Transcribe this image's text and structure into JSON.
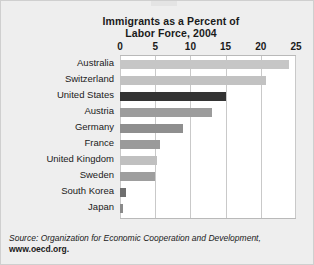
{
  "chart_data": {
    "type": "bar",
    "orientation": "horizontal",
    "title": "Immigrants as a Percent of Labor Force, 2004",
    "title_lines": [
      "Immigrants as a Percent of",
      "Labor Force, 2004"
    ],
    "xlabel": "",
    "ylabel": "",
    "xlim": [
      0,
      25
    ],
    "xticks": [
      0,
      5,
      10,
      15,
      20,
      25
    ],
    "xtick_labels": [
      "0",
      "5",
      "10",
      "15",
      "20",
      "25"
    ],
    "grid": true,
    "grid_axis": "x",
    "legend": false,
    "categories": [
      "Australia",
      "Switzerland",
      "United States",
      "Austria",
      "Germany",
      "France",
      "United Kingdom",
      "Sweden",
      "South Korea",
      "Japan"
    ],
    "values": [
      24.0,
      20.7,
      15.0,
      13.0,
      9.0,
      5.7,
      5.2,
      5.0,
      0.8,
      0.4
    ],
    "bar_colors": [
      "#c6c6c6",
      "#c2c2c2",
      "#333333",
      "#9c9c9c",
      "#8f8f8f",
      "#9a9a9a",
      "#c0c0c0",
      "#9e9e9e",
      "#6f6f6f",
      "#8a8a8a"
    ],
    "source_prefix": "Source: Organization for Economic Cooperation and Development,",
    "source_url": "www.oecd.org."
  },
  "colors": {
    "figure_background": "#eeeeee",
    "plot_background": "#ffffff",
    "gridline": "#c9c9c9",
    "axis": "#b9b9b9",
    "text": "#1a1a1a",
    "highlight_bar": "#333333"
  }
}
